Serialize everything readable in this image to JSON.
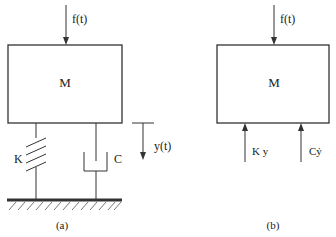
{
  "diagram": {
    "colors": {
      "stroke": "#333333",
      "text": "#222222",
      "background": "#ffffff"
    },
    "panel_a": {
      "caption": "(a)",
      "mass_label": "M",
      "force_label": "f(t)",
      "spring_label": "K",
      "damper_label": "C",
      "displacement_label": "y(t)"
    },
    "panel_b": {
      "caption": "(b)",
      "mass_label": "M",
      "force_label": "f(t)",
      "spring_force_label": "K y",
      "damper_force_label": "Cẏ"
    }
  }
}
